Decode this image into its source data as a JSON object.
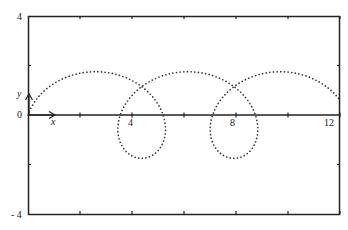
{
  "chart_data": {
    "type": "line",
    "title": "",
    "xlabel": "x",
    "ylabel": "y",
    "xlim": [
      0,
      12
    ],
    "ylim": [
      -4,
      4
    ],
    "x_ticks": [
      2,
      4,
      6,
      8,
      10,
      12
    ],
    "x_tick_labels": [
      "4",
      "8",
      "12"
    ],
    "y_tick_labels": [
      "4",
      "0",
      "-4"
    ],
    "style": "dotted",
    "grid": false,
    "series": [
      {
        "name": "curve",
        "parametric": {
          "a": 0.565,
          "b": 1.71,
          "c": 1.75,
          "t_start": 0,
          "t_end": 18.0
        },
        "key_points": [
          {
            "x": 0,
            "y": 0
          },
          {
            "x": 2.6,
            "y": 1.75
          },
          {
            "x": 5.2,
            "y": 0
          },
          {
            "x": 4.4,
            "y": -1.75
          },
          {
            "x": 3.55,
            "y": 0
          },
          {
            "x": 6.15,
            "y": 1.75
          },
          {
            "x": 8.75,
            "y": 0
          },
          {
            "x": 7.95,
            "y": -1.75
          },
          {
            "x": 7.1,
            "y": 0
          },
          {
            "x": 9.7,
            "y": 1.75
          },
          {
            "x": 12,
            "y": 0.5
          }
        ]
      }
    ]
  },
  "labels": {
    "y_top": "4",
    "y_zero": "0",
    "y_bottom": "- 4",
    "x_4": "4",
    "x_8": "8",
    "x_12": "12",
    "x_axis": "x",
    "y_axis": "y"
  }
}
